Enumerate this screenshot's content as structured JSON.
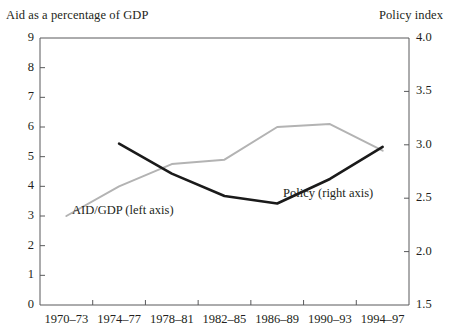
{
  "chart_data": {
    "type": "line",
    "title": "",
    "categories": [
      "1970–73",
      "1974–77",
      "1978–81",
      "1982–85",
      "1986–89",
      "1990–93",
      "1994–97"
    ],
    "xlabel": "",
    "left_axis": {
      "label": "Aid as a percentage of GDP",
      "ylim": [
        0,
        9
      ],
      "ticks": [
        "0",
        "1",
        "2",
        "3",
        "4",
        "5",
        "6",
        "7",
        "8",
        "9"
      ],
      "tick_values": [
        0,
        1,
        2,
        3,
        4,
        5,
        6,
        7,
        8,
        9
      ]
    },
    "right_axis": {
      "label": "Policy index",
      "ylim": [
        1.5,
        4.0
      ],
      "ticks": [
        "1.5",
        "2.0",
        "2.5",
        "3.0",
        "3.5",
        "4.0"
      ],
      "tick_values": [
        1.5,
        2.0,
        2.5,
        3.0,
        3.5,
        4.0
      ]
    },
    "grid": false,
    "legend": "inline-annotations",
    "series": [
      {
        "name": "AID/GDP (left axis)",
        "axis": "left",
        "color": "#b3b3b3",
        "label_text": "AID/GDP (left axis)",
        "values": [
          3.0,
          4.0,
          4.75,
          4.9,
          6.0,
          6.1,
          5.2
        ]
      },
      {
        "name": "Policy (right axis)",
        "axis": "right",
        "color": "#1a1a1a",
        "label_text": "Policy (right axis)",
        "values": [
          null,
          3.01,
          2.73,
          2.52,
          2.45,
          2.68,
          2.98
        ]
      }
    ],
    "annotations": [
      {
        "text": "AID/GDP (left axis)",
        "series": "AID/GDP (left axis)"
      },
      {
        "text": "Policy (right axis)",
        "series": "Policy (right axis)"
      }
    ]
  }
}
